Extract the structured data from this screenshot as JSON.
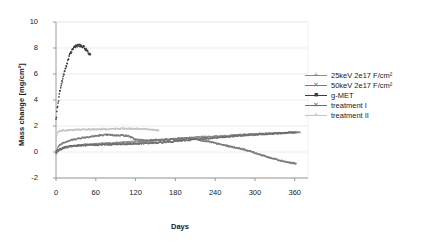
{
  "chart_data": {
    "type": "line",
    "title": "",
    "xlabel": "Days",
    "ylabel": "Mass change [mg/cm²]",
    "xlim": [
      0,
      380
    ],
    "ylim": [
      -2,
      10
    ],
    "xticks": [
      0,
      60,
      120,
      180,
      240,
      300,
      360
    ],
    "ytickvals": [
      10,
      8,
      6,
      4,
      2,
      0,
      -2
    ],
    "xtick_labels": [
      "0",
      "60",
      "120",
      "180",
      "240",
      "300",
      "360"
    ],
    "ytick_labels": [
      "10",
      "8",
      "6",
      "4",
      "2",
      "0",
      "-2"
    ],
    "grid": "horizontal",
    "legend_position": "right",
    "series": [
      {
        "name": "25keV 2e17 F/cm²",
        "color": "#8c8c8c",
        "marker": "plus",
        "x": [
          0,
          5,
          12,
          20,
          30,
          45,
          60,
          75,
          90,
          105,
          120,
          140,
          160,
          180,
          200,
          220,
          240,
          260,
          280,
          300,
          320,
          340,
          360,
          368
        ],
        "y": [
          -0.15,
          0.15,
          0.3,
          0.42,
          0.5,
          0.58,
          0.62,
          0.66,
          0.7,
          0.75,
          0.8,
          0.85,
          0.92,
          1.0,
          1.08,
          1.15,
          1.2,
          1.26,
          1.32,
          1.38,
          1.42,
          1.46,
          1.5,
          1.5
        ]
      },
      {
        "name": "50keV 2e17 F/cm²",
        "color": "#7a7a7a",
        "marker": "cross",
        "x": [
          0,
          4,
          10,
          18,
          28,
          40,
          55,
          70,
          80,
          90,
          100,
          110,
          120,
          135,
          150,
          165,
          180,
          195,
          205,
          215,
          230,
          245,
          260,
          275,
          290,
          305,
          320,
          335,
          350,
          362
        ],
        "y": [
          0.1,
          0.45,
          0.7,
          0.85,
          0.98,
          1.1,
          1.2,
          1.3,
          1.32,
          1.28,
          1.3,
          1.22,
          0.95,
          0.9,
          0.92,
          0.95,
          1.0,
          1.05,
          1.05,
          0.95,
          0.8,
          0.62,
          0.45,
          0.3,
          0.1,
          -0.15,
          -0.4,
          -0.6,
          -0.8,
          -0.9
        ]
      },
      {
        "name": "g-MET",
        "color": "#3a3a3a",
        "marker": "square",
        "x": [
          0,
          2,
          4,
          6,
          8,
          10,
          13,
          16,
          19,
          22,
          25,
          28,
          31,
          34,
          37,
          40,
          43,
          46,
          49,
          52
        ],
        "y": [
          2.45,
          3.4,
          4.1,
          4.7,
          5.2,
          5.6,
          6.2,
          6.7,
          7.2,
          7.6,
          7.9,
          8.1,
          8.2,
          8.2,
          8.15,
          8.1,
          8.0,
          7.85,
          7.6,
          7.5
        ]
      },
      {
        "name": "treatment I",
        "color": "#6e6e6e",
        "marker": "cross",
        "x": [
          0,
          5,
          12,
          22,
          35,
          50,
          65,
          80,
          95,
          110,
          125,
          140,
          155,
          170,
          185,
          200,
          215,
          230,
          245,
          260,
          275,
          290,
          305,
          320,
          335,
          350,
          362
        ],
        "y": [
          0.0,
          0.2,
          0.35,
          0.45,
          0.5,
          0.52,
          0.55,
          0.58,
          0.6,
          0.62,
          0.64,
          0.68,
          0.72,
          0.78,
          0.85,
          0.92,
          1.0,
          1.06,
          1.12,
          1.18,
          1.24,
          1.3,
          1.35,
          1.4,
          1.44,
          1.48,
          1.5
        ]
      },
      {
        "name": "treatment II",
        "color": "#c4c4c4",
        "marker": "plus",
        "x": [
          0,
          3,
          8,
          15,
          25,
          40,
          55,
          70,
          85,
          100,
          115,
          130,
          145,
          155
        ],
        "y": [
          1.05,
          1.55,
          1.65,
          1.68,
          1.7,
          1.72,
          1.74,
          1.76,
          1.78,
          1.8,
          1.8,
          1.78,
          1.72,
          1.68
        ]
      }
    ]
  },
  "axes": {
    "x_title": "Days",
    "y_title": "Mass change [mg/cm²]"
  },
  "legend": {
    "items": [
      {
        "label": "25keV 2e17 F/cm²",
        "color": "#8c8c8c",
        "glyph": "+"
      },
      {
        "label": "50keV 2e17 F/cm²",
        "color": "#7a7a7a",
        "glyph": "✕"
      },
      {
        "label": "g-MET",
        "color": "#3a3a3a",
        "glyph": "■"
      },
      {
        "label": "treatment I",
        "color": "#6e6e6e",
        "glyph": "✕"
      },
      {
        "label": "treatment II",
        "color": "#c4c4c4",
        "glyph": "+"
      }
    ]
  },
  "colors": {
    "grid": "#e9e9e9",
    "axis": "#9a9a9a",
    "text": "#1a1a1a",
    "background": "#ffffff"
  }
}
